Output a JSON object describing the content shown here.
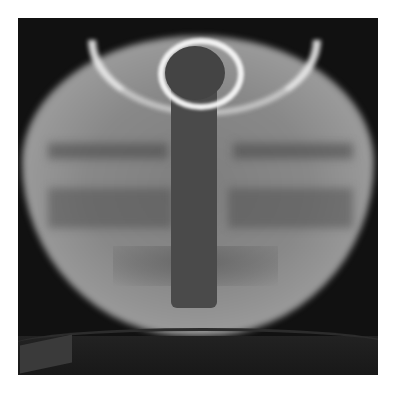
{
  "image": {
    "description": "Grayscale photograph of a glowing spherical tokamak plasma with a dark central column",
    "colors": {
      "background": "#ffffff",
      "frame": "#111111",
      "plasma": "#8a8a8a",
      "highlight": "#f2f2f2",
      "column": "#4a4a4a"
    }
  }
}
